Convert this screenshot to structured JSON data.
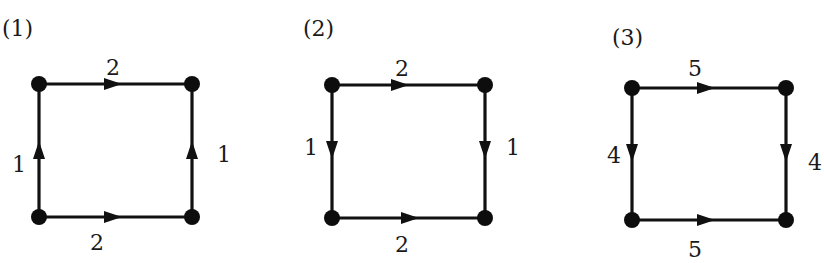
{
  "colors": {
    "ink": "#111111",
    "background": "#ffffff"
  },
  "diagrams": [
    {
      "id": "1",
      "title": "(1)",
      "title_pos": [
        2,
        36
      ],
      "nodes": {
        "tl": [
          39,
          84
        ],
        "tr": [
          192,
          84
        ],
        "bl": [
          39,
          217
        ],
        "br": [
          192,
          217
        ]
      },
      "edges": [
        {
          "name": "top",
          "from": "tl",
          "to": "tr",
          "direction": "right",
          "label": "2",
          "arrow_at": [
            113,
            84
          ],
          "label_pos": [
            113,
            75
          ]
        },
        {
          "name": "bottom",
          "from": "bl",
          "to": "br",
          "direction": "right",
          "label": "2",
          "arrow_at": [
            113,
            217
          ],
          "label_pos": [
            97,
            250
          ]
        },
        {
          "name": "left",
          "from": "bl",
          "to": "tl",
          "direction": "up",
          "label": "1",
          "arrow_at": [
            39,
            150
          ],
          "label_pos": [
            19,
            172
          ]
        },
        {
          "name": "right",
          "from": "br",
          "to": "tr",
          "direction": "up",
          "label": "1",
          "arrow_at": [
            192,
            150
          ],
          "label_pos": [
            224,
            162
          ]
        }
      ]
    },
    {
      "id": "2",
      "title": "(2)",
      "title_pos": [
        303,
        36
      ],
      "nodes": {
        "tl": [
          332,
          85
        ],
        "tr": [
          485,
          85
        ],
        "bl": [
          332,
          218
        ],
        "br": [
          485,
          218
        ]
      },
      "edges": [
        {
          "name": "top",
          "from": "tl",
          "to": "tr",
          "direction": "right",
          "label": "2",
          "arrow_at": [
            400,
            85
          ],
          "label_pos": [
            402,
            76
          ]
        },
        {
          "name": "bottom",
          "from": "bl",
          "to": "br",
          "direction": "right",
          "label": "2",
          "arrow_at": [
            410,
            218
          ],
          "label_pos": [
            402,
            252
          ]
        },
        {
          "name": "left",
          "from": "tl",
          "to": "bl",
          "direction": "down",
          "label": "1",
          "arrow_at": [
            332,
            150
          ],
          "label_pos": [
            311,
            155
          ]
        },
        {
          "name": "right",
          "from": "tr",
          "to": "br",
          "direction": "down",
          "label": "1",
          "arrow_at": [
            485,
            150
          ],
          "label_pos": [
            513,
            155
          ]
        }
      ]
    },
    {
      "id": "3",
      "title": "(3)",
      "title_pos": [
        612,
        45
      ],
      "nodes": {
        "tl": [
          632,
          88
        ],
        "tr": [
          786,
          88
        ],
        "bl": [
          632,
          220
        ],
        "br": [
          786,
          220
        ]
      },
      "edges": [
        {
          "name": "top",
          "from": "tl",
          "to": "tr",
          "direction": "right",
          "label": "5",
          "arrow_at": [
            706,
            88
          ],
          "label_pos": [
            695,
            76
          ]
        },
        {
          "name": "bottom",
          "from": "bl",
          "to": "br",
          "direction": "right",
          "label": "5",
          "arrow_at": [
            706,
            220
          ],
          "label_pos": [
            695,
            257
          ]
        },
        {
          "name": "left",
          "from": "tl",
          "to": "bl",
          "direction": "down",
          "label": "4",
          "arrow_at": [
            632,
            153
          ],
          "label_pos": [
            614,
            163
          ]
        },
        {
          "name": "right",
          "from": "tr",
          "to": "br",
          "direction": "down",
          "label": "4",
          "arrow_at": [
            786,
            153
          ],
          "label_pos": [
            815,
            170
          ]
        }
      ]
    }
  ]
}
